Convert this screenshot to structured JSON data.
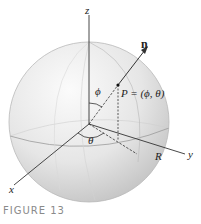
{
  "figure": {
    "caption": "FIGURE 13",
    "labels": {
      "z_axis": "z",
      "x_axis": "x",
      "y_axis": "y",
      "normal": "n",
      "point": "P = (ϕ, θ)",
      "phi": "ϕ",
      "theta": "θ",
      "radius": "R"
    },
    "colors": {
      "sphere_light": "#f4f4f4",
      "sphere_dark": "#c8c8c8",
      "axis": "#333333",
      "caption": "#8a8a8a"
    }
  }
}
